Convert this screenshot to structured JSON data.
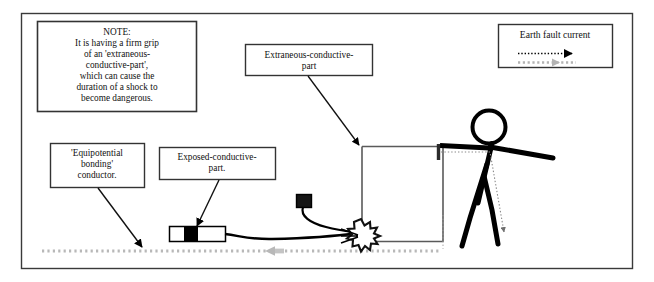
{
  "figure": {
    "border_color": "#3a3a3a",
    "background": "#ffffff"
  },
  "note_box": {
    "name": "note-box",
    "text": "NOTE:\nIt is having a firm grip\nof an 'extraneous-\nconductive-part',\nwhich can cause the\nduration of a shock to\nbecome dangerous."
  },
  "legend": {
    "name": "legend-box",
    "title": "Earth fault current",
    "entries": [
      {
        "style": "dotted-arrow",
        "color": "#000000",
        "direction": "right"
      },
      {
        "style": "dashed-arrow",
        "color": "#9a9a9a",
        "direction": "right"
      }
    ]
  },
  "callouts": [
    {
      "id": "extraneous-conductive-part",
      "label": "Extraneous-conductive-\npart",
      "points_to": "pipe-frame-top-left-corner"
    },
    {
      "id": "equipotential-bonding-conductor",
      "label": "'Equipotential\nbonding'\nconductor.",
      "points_to": "bonding-conductor-line"
    },
    {
      "id": "exposed-conductive-part",
      "label": "Exposed-conductive-\npart.",
      "points_to": "appliance-metal-casing"
    }
  ],
  "scene": {
    "appliance": {
      "name": "electrical-appliance",
      "fill": "#ffffff",
      "stroke": "#000000"
    },
    "appliance_metal_band": {
      "name": "appliance-metal-casing",
      "fill": "#000000"
    },
    "plug": {
      "name": "plug-block",
      "fill": "#1a1a1a"
    },
    "cable": {
      "name": "supply-cable",
      "stroke": "#000000"
    },
    "pipe_frame": {
      "name": "extraneous-conductive-part-pipe",
      "stroke": "#555555"
    },
    "fault_spark": {
      "name": "fault-spark",
      "fill": "#ffffff",
      "stroke": "#000000"
    },
    "person": {
      "name": "stick-figure-person",
      "stroke": "#000000"
    },
    "bonding_conductor": {
      "name": "equipotential-bonding-conductor",
      "color": "#b0b0b0"
    },
    "body_current_path": {
      "name": "body-fault-current-path",
      "color": "#777777"
    }
  },
  "colors": {
    "black": "#000000",
    "gray_line": "#b0b0b0",
    "pipe_gray": "#555555",
    "frame": "#3a3a3a"
  }
}
